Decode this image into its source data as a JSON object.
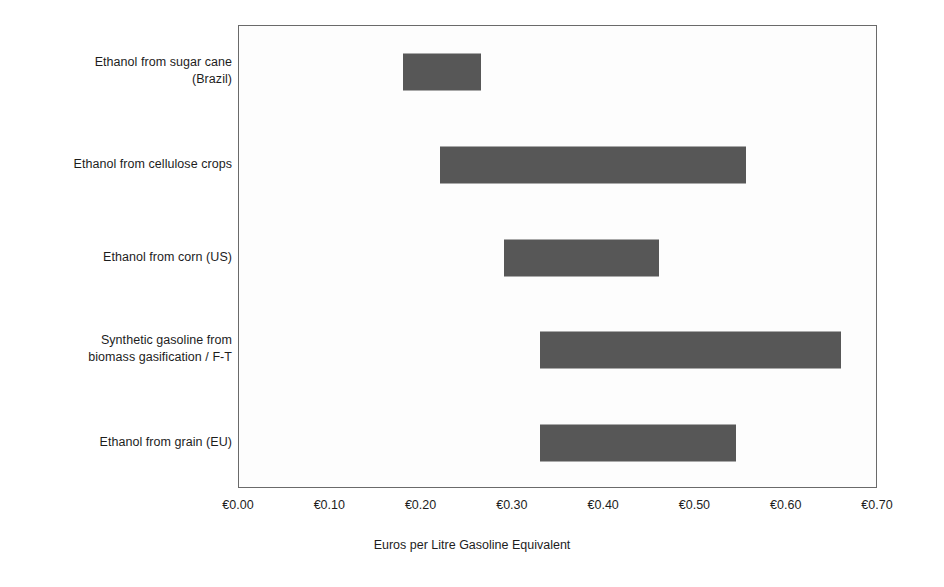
{
  "chart_data": {
    "type": "bar",
    "subtype": "floating-range-bar",
    "title": "",
    "xlabel": "Euros per Litre Gasoline Equivalent",
    "ylabel": "",
    "xlim": [
      0.0,
      0.7
    ],
    "xtick_labels": [
      "€0.00",
      "€0.10",
      "€0.20",
      "€0.30",
      "€0.40",
      "€0.50",
      "€0.60",
      "€0.70"
    ],
    "xtick_values": [
      0.0,
      0.1,
      0.2,
      0.3,
      0.4,
      0.5,
      0.6,
      0.7
    ],
    "grid": false,
    "legend": "none",
    "bar_color": "#575757",
    "plot_background": "#fdfdfd",
    "axis_color": "#6a6a6a",
    "categories": [
      "Ethanol from sugar cane\n(Brazil)",
      "Ethanol from cellulose crops",
      "Ethanol from corn (US)",
      "Synthetic gasoline from\nbiomass gasification / F-T",
      "Ethanol from grain (EU)"
    ],
    "bars": [
      {
        "category": "Ethanol from sugar cane (Brazil)",
        "low": 0.18,
        "high": 0.265
      },
      {
        "category": "Ethanol from cellulose crops",
        "low": 0.22,
        "high": 0.555
      },
      {
        "category": "Ethanol from corn (US)",
        "low": 0.29,
        "high": 0.46
      },
      {
        "category": "Synthetic gasoline from biomass gasification / F-T",
        "low": 0.33,
        "high": 0.66
      },
      {
        "category": "Ethanol from grain (EU)",
        "low": 0.33,
        "high": 0.545
      }
    ]
  }
}
